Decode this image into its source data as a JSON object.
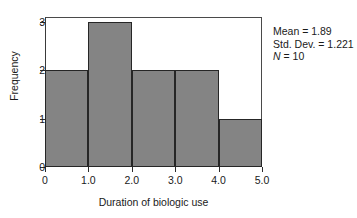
{
  "chart_data": {
    "type": "bar",
    "title": "",
    "subtitle": "",
    "xlabel": "Duration of biologic use",
    "ylabel": "Frequency",
    "categories": [
      "0.0-1.0",
      "1.0-2.0",
      "2.0-3.0",
      "3.0-4.0",
      "4.0-5.0"
    ],
    "bin_edges": [
      0.0,
      1.0,
      2.0,
      3.0,
      4.0,
      5.0
    ],
    "values": [
      2,
      3,
      2,
      2,
      1
    ],
    "bar_color": "#848484",
    "bar_edge_color": "#262626",
    "xlim": [
      0.0,
      5.0
    ],
    "ylim": [
      0,
      3
    ],
    "x_ticks": [
      {
        "value": 0.0,
        "label": "0"
      },
      {
        "value": 1.0,
        "label": "1.0"
      },
      {
        "value": 2.0,
        "label": "2.0"
      },
      {
        "value": 3.0,
        "label": "3.0"
      },
      {
        "value": 4.0,
        "label": "4.0"
      },
      {
        "value": 5.0,
        "label": "5.0"
      }
    ],
    "y_ticks": [
      {
        "value": 0,
        "label": "0"
      },
      {
        "value": 1,
        "label": "1"
      },
      {
        "value": 2,
        "label": "2"
      },
      {
        "value": 3,
        "label": "3"
      }
    ],
    "grid": false,
    "legend": null,
    "annotations": {
      "mean_label": "Mean = 1.89",
      "std_dev_label": "Std. Dev. = 1.221",
      "n_symbol": "N",
      "n_value": " = 10",
      "position": "top-right"
    }
  },
  "figure": {
    "background_color": "#ffffff",
    "text_color": "#1a1a1a"
  }
}
